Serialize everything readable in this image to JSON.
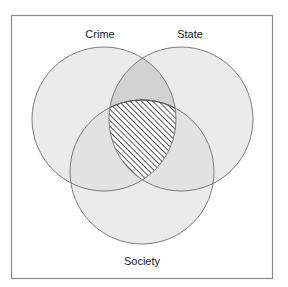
{
  "figure": {
    "type": "venn-diagram",
    "set_count": 3,
    "background_color": "#ffffff",
    "frame": {
      "x": 11,
      "y": 15,
      "width": 261,
      "height": 263,
      "stroke_color": "#8c8c8c",
      "stroke_width": 1.2,
      "fill_color": "#ffffff"
    },
    "style": {
      "circle_fill": "#ebebeb",
      "circle_stroke": "#6e6e6e",
      "circle_stroke_width": 0.9,
      "pair_overlap_fill": "#d2d2d2",
      "triple_overlap_fill": "#ffffff",
      "hatch_color": "#111111",
      "hatch_angle_deg": 45,
      "hatch_spacing_px": 4,
      "hatch_stroke_width": 1.4,
      "label_color": "#1a1a1a",
      "label_font_size_px": 11
    },
    "circles": [
      {
        "id": "crime",
        "label": "Crime",
        "cx": 104,
        "cy": 119,
        "r": 72,
        "label_x": 100,
        "label_y": 35,
        "label_position": "top-left"
      },
      {
        "id": "state",
        "label": "State",
        "cx": 181,
        "cy": 119,
        "r": 72,
        "label_x": 190,
        "label_y": 35,
        "label_position": "top-right"
      },
      {
        "id": "society",
        "label": "Society",
        "cx": 142,
        "cy": 172,
        "r": 72,
        "label_x": 142,
        "label_y": 262,
        "label_position": "bottom-center"
      }
    ],
    "regions": [
      {
        "id": "crime-only",
        "sets": [
          "crime"
        ],
        "fill": "#ebebeb",
        "hatched": false
      },
      {
        "id": "state-only",
        "sets": [
          "state"
        ],
        "fill": "#ebebeb",
        "hatched": false
      },
      {
        "id": "society-only",
        "sets": [
          "society"
        ],
        "fill": "#ebebeb",
        "hatched": false
      },
      {
        "id": "crime-state",
        "sets": [
          "crime",
          "state"
        ],
        "fill": "#d2d2d2",
        "hatched": false
      },
      {
        "id": "crime-society",
        "sets": [
          "crime",
          "society"
        ],
        "fill": "#e2e2e2",
        "hatched": false
      },
      {
        "id": "state-society",
        "sets": [
          "state",
          "society"
        ],
        "fill": "#e2e2e2",
        "hatched": false
      },
      {
        "id": "crime-state-society",
        "sets": [
          "crime",
          "state",
          "society"
        ],
        "fill": "#ffffff",
        "hatched": true,
        "emphasis": "highlighted"
      }
    ]
  }
}
